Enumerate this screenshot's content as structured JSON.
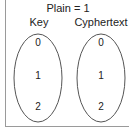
{
  "diagram": {
    "title": "Plain = 1",
    "sets": [
      {
        "label": "Key",
        "elements": [
          "0",
          "1",
          "2"
        ]
      },
      {
        "label": "Cyphertext",
        "elements": [
          "0",
          "1",
          "2"
        ]
      }
    ]
  }
}
